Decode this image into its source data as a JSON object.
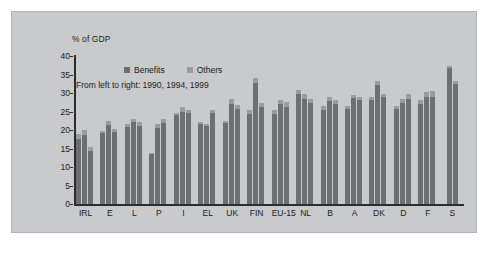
{
  "chart_data": {
    "type": "bar",
    "title": "",
    "subtitle": "",
    "axis_title": "% of GDP",
    "note": "From left to right: 1990, 1994, 1999",
    "xlabel": "",
    "ylabel": "% of GDP",
    "ylim": [
      0,
      40
    ],
    "yticks": [
      0,
      5,
      10,
      15,
      20,
      25,
      30,
      35,
      40
    ],
    "grid": false,
    "stacked": true,
    "legend_position": "top-center",
    "legend": [
      {
        "name": "Benefits",
        "color": "#6e6f70"
      },
      {
        "name": "Others",
        "color": "#9a9b9c"
      }
    ],
    "years": [
      "1990",
      "1994",
      "1999"
    ],
    "categories": [
      "IRL",
      "E",
      "L",
      "P",
      "I",
      "EL",
      "UK",
      "FIN",
      "EU-15",
      "NL",
      "B",
      "A",
      "DK",
      "D",
      "F",
      "S"
    ],
    "groups": [
      {
        "label": "IRL",
        "bars": [
          {
            "year": "1990",
            "benefits": 17.6,
            "others": 1.2,
            "total": 18.8
          },
          {
            "year": "1994",
            "benefits": 18.6,
            "others": 1.4,
            "total": 20.0
          },
          {
            "year": "1999",
            "benefits": 14.3,
            "others": 1.0,
            "total": 15.3
          }
        ]
      },
      {
        "label": "E",
        "bars": [
          {
            "year": "1990",
            "benefits": 19.2,
            "others": 0.6,
            "total": 19.8
          },
          {
            "year": "1994",
            "benefits": 21.4,
            "others": 1.0,
            "total": 22.4
          },
          {
            "year": "1999",
            "benefits": 19.4,
            "others": 0.8,
            "total": 20.2
          }
        ]
      },
      {
        "label": "L",
        "bars": [
          {
            "year": "1990",
            "benefits": 20.9,
            "others": 0.8,
            "total": 21.7
          },
          {
            "year": "1994",
            "benefits": 22.2,
            "others": 0.9,
            "total": 23.1
          },
          {
            "year": "1999",
            "benefits": 21.2,
            "others": 0.9,
            "total": 22.1
          }
        ]
      },
      {
        "label": "P",
        "bars": [
          {
            "year": "1990",
            "benefits": 13.6,
            "others": 0.3,
            "total": 13.9
          },
          {
            "year": "1994",
            "benefits": 20.5,
            "others": 1.2,
            "total": 21.7
          },
          {
            "year": "1999",
            "benefits": 21.8,
            "others": 1.2,
            "total": 23.0
          }
        ]
      },
      {
        "label": "I",
        "bars": [
          {
            "year": "1990",
            "benefits": 24.0,
            "others": 0.5,
            "total": 24.5
          },
          {
            "year": "1994",
            "benefits": 25.0,
            "others": 1.1,
            "total": 26.1
          },
          {
            "year": "1999",
            "benefits": 24.6,
            "others": 0.8,
            "total": 25.4
          }
        ]
      },
      {
        "label": "EL",
        "bars": [
          {
            "year": "1990",
            "benefits": 21.6,
            "others": 0.7,
            "total": 22.3
          },
          {
            "year": "1994",
            "benefits": 21.0,
            "others": 0.6,
            "total": 21.6
          },
          {
            "year": "1999",
            "benefits": 24.5,
            "others": 0.8,
            "total": 25.3
          }
        ]
      },
      {
        "label": "UK",
        "bars": [
          {
            "year": "1990",
            "benefits": 21.8,
            "others": 0.7,
            "total": 22.5
          },
          {
            "year": "1994",
            "benefits": 27.1,
            "others": 1.4,
            "total": 28.5
          },
          {
            "year": "1999",
            "benefits": 25.8,
            "others": 1.0,
            "total": 26.8
          }
        ]
      },
      {
        "label": "FIN",
        "bars": [
          {
            "year": "1990",
            "benefits": 24.2,
            "others": 1.1,
            "total": 25.3
          },
          {
            "year": "1994",
            "benefits": 32.8,
            "others": 1.3,
            "total": 34.1
          },
          {
            "year": "1999",
            "benefits": 26.1,
            "others": 1.1,
            "total": 27.2
          }
        ]
      },
      {
        "label": "EU-15",
        "bars": [
          {
            "year": "1990",
            "benefits": 24.4,
            "others": 1.1,
            "total": 25.5
          },
          {
            "year": "1994",
            "benefits": 26.9,
            "others": 1.2,
            "total": 28.1
          },
          {
            "year": "1999",
            "benefits": 26.3,
            "others": 1.2,
            "total": 27.5
          }
        ]
      },
      {
        "label": "NL",
        "bars": [
          {
            "year": "1990",
            "benefits": 29.7,
            "others": 1.2,
            "total": 30.9
          },
          {
            "year": "1994",
            "benefits": 28.5,
            "others": 1.3,
            "total": 29.8
          },
          {
            "year": "1999",
            "benefits": 27.2,
            "others": 1.1,
            "total": 28.3
          }
        ]
      },
      {
        "label": "B",
        "bars": [
          {
            "year": "1990",
            "benefits": 25.4,
            "others": 1.1,
            "total": 26.5
          },
          {
            "year": "1994",
            "benefits": 27.8,
            "others": 1.2,
            "total": 29.0
          },
          {
            "year": "1999",
            "benefits": 27.0,
            "others": 1.2,
            "total": 28.2
          }
        ]
      },
      {
        "label": "A",
        "bars": [
          {
            "year": "1990",
            "benefits": 25.8,
            "others": 0.8,
            "total": 26.6
          },
          {
            "year": "1994",
            "benefits": 28.7,
            "others": 0.8,
            "total": 29.5
          },
          {
            "year": "1999",
            "benefits": 28.0,
            "others": 0.8,
            "total": 28.8
          }
        ]
      },
      {
        "label": "DK",
        "bars": [
          {
            "year": "1990",
            "benefits": 28.1,
            "others": 0.9,
            "total": 29.0
          },
          {
            "year": "1994",
            "benefits": 32.2,
            "others": 1.1,
            "total": 33.3
          },
          {
            "year": "1999",
            "benefits": 28.8,
            "others": 0.9,
            "total": 29.7
          }
        ]
      },
      {
        "label": "D",
        "bars": [
          {
            "year": "1990",
            "benefits": 25.6,
            "others": 0.9,
            "total": 26.5
          },
          {
            "year": "1994",
            "benefits": 27.3,
            "others": 1.2,
            "total": 28.5
          },
          {
            "year": "1999",
            "benefits": 28.4,
            "others": 1.2,
            "total": 29.6
          }
        ]
      },
      {
        "label": "F",
        "bars": [
          {
            "year": "1990",
            "benefits": 26.9,
            "others": 1.1,
            "total": 28.0
          },
          {
            "year": "1994",
            "benefits": 28.9,
            "others": 1.5,
            "total": 30.4
          },
          {
            "year": "1999",
            "benefits": 29.0,
            "others": 1.5,
            "total": 30.5
          }
        ]
      },
      {
        "label": "S",
        "bars": [
          {
            "year": "1990",
            "benefits": 36.7,
            "others": 0.5,
            "total": 37.2
          },
          {
            "year": "1999",
            "benefits": 32.4,
            "others": 0.8,
            "total": 33.2
          }
        ]
      }
    ],
    "colors": {
      "benefits": "#6e6f70",
      "others": "#9a9b9c",
      "plot_background": "#c9cacb",
      "axis": "#2c2c2c",
      "text": "#1c1c1c"
    }
  }
}
